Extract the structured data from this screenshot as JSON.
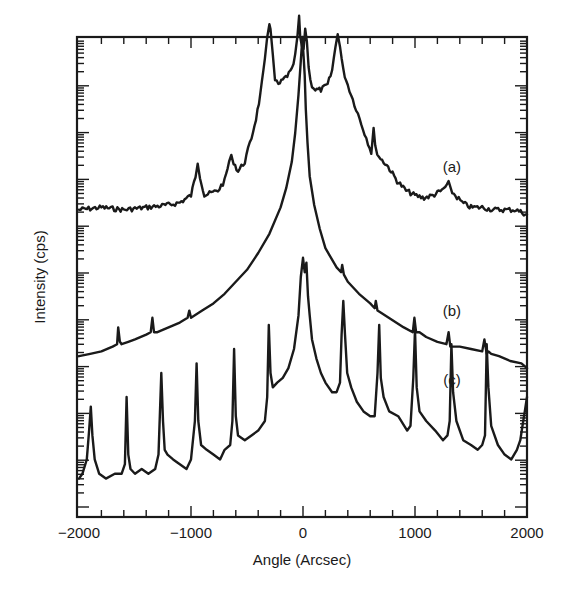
{
  "chart_data": {
    "type": "line",
    "title": "",
    "xlabel": "Angle (Arcsec)",
    "ylabel": "Intensity (cps)",
    "xlim": [
      -2000,
      2000
    ],
    "ylim": [
      0,
      100
    ],
    "y_units_note": "relative (arb.), no y tick labels shown",
    "x_ticks": [
      {
        "value": -2000,
        "label": "−2000"
      },
      {
        "value": -1000,
        "label": "−1000"
      },
      {
        "value": 0,
        "label": "0"
      },
      {
        "value": 1000,
        "label": "1000"
      },
      {
        "value": 2000,
        "label": "2000"
      }
    ],
    "x_minor_step": 200,
    "y_major_count": 10,
    "grid": false,
    "series": [
      {
        "name": "(a)",
        "label_at": {
          "x": 1330,
          "y": 73
        },
        "noisy": true,
        "x": [
          -2000,
          -1800,
          -1600,
          -1400,
          -1200,
          -1100,
          -1000,
          -960,
          -940,
          -920,
          -880,
          -820,
          -760,
          -700,
          -660,
          -640,
          -620,
          -580,
          -520,
          -460,
          -420,
          -380,
          -340,
          -320,
          -300,
          -290,
          -270,
          -250,
          -220,
          -180,
          -140,
          -100,
          -70,
          -50,
          -35,
          -25,
          -10,
          5,
          20,
          35,
          50,
          65,
          80,
          110,
          160,
          220,
          260,
          290,
          310,
          330,
          360,
          400,
          460,
          520,
          580,
          610,
          630,
          645,
          680,
          760,
          840,
          920,
          1000,
          1080,
          1160,
          1240,
          1300,
          1320,
          1360,
          1420,
          1500,
          1600,
          1700,
          1800,
          1900,
          2000
        ],
        "y": [
          64,
          64.5,
          64,
          64.5,
          65,
          65.5,
          67,
          71,
          74,
          71,
          67,
          67.5,
          68,
          70,
          74,
          75,
          74,
          72,
          74,
          79,
          83,
          88,
          95,
          100,
          103,
          102,
          96,
          91,
          90,
          91,
          92,
          93,
          96,
          100,
          104,
          100,
          98,
          97,
          102,
          99,
          94,
          91,
          90,
          89,
          89,
          90,
          93,
          98,
          101,
          98,
          93,
          90,
          86,
          82,
          78,
          76,
          81,
          77,
          75,
          73,
          70,
          68,
          67,
          66.5,
          67,
          68,
          69.5,
          68,
          67,
          65.5,
          64.5,
          64.5,
          64,
          64,
          64,
          63
        ]
      },
      {
        "name": "(b)",
        "label_at": {
          "x": 1330,
          "y": 43
        },
        "noisy": false,
        "x": [
          -2000,
          -1900,
          -1800,
          -1700,
          -1660,
          -1650,
          -1635,
          -1620,
          -1560,
          -1500,
          -1400,
          -1360,
          -1345,
          -1330,
          -1300,
          -1200,
          -1100,
          -1030,
          -1015,
          -1000,
          -900,
          -800,
          -700,
          -600,
          -500,
          -400,
          -300,
          -200,
          -150,
          -100,
          -70,
          -40,
          -20,
          -5,
          5,
          15,
          25,
          40,
          60,
          100,
          150,
          200,
          300,
          340,
          350,
          365,
          400,
          500,
          600,
          640,
          650,
          665,
          700,
          800,
          900,
          980,
          995,
          1010,
          1040,
          1100,
          1200,
          1280,
          1300,
          1315,
          1340,
          1400,
          1500,
          1600,
          1620,
          1640,
          1655,
          1680,
          1750,
          1850,
          1950,
          2000
        ],
        "y": [
          33.5,
          34,
          34.5,
          35.5,
          36,
          39.5,
          36.5,
          36,
          36.5,
          37,
          38,
          38.5,
          41.5,
          38.5,
          38.5,
          39.5,
          40.5,
          41.5,
          43,
          41.5,
          43,
          44.5,
          46.5,
          49,
          51.5,
          55,
          59,
          64.5,
          68.5,
          74,
          80,
          88,
          95,
          100,
          96,
          92,
          85,
          78,
          71,
          65,
          60,
          56,
          52,
          51,
          52.5,
          50.5,
          49,
          46.5,
          44.5,
          43.5,
          45,
          43,
          42.5,
          41,
          39.5,
          38.5,
          41.5,
          38.5,
          38.5,
          37.5,
          36.5,
          36,
          38.5,
          35.5,
          35.5,
          35.5,
          35,
          34.5,
          37,
          34,
          34.5,
          34,
          33.5,
          32.5,
          32,
          31
        ]
      },
      {
        "name": "(c)",
        "label_at": {
          "x": 1330,
          "y": 28.5
        },
        "noisy": false,
        "x": [
          -2000,
          -1970,
          -1930,
          -1910,
          -1895,
          -1880,
          -1860,
          -1820,
          -1760,
          -1680,
          -1620,
          -1590,
          -1575,
          -1560,
          -1540,
          -1500,
          -1440,
          -1380,
          -1320,
          -1290,
          -1265,
          -1250,
          -1235,
          -1210,
          -1160,
          -1100,
          -1040,
          -1000,
          -965,
          -950,
          -935,
          -910,
          -860,
          -800,
          -740,
          -700,
          -650,
          -630,
          -615,
          -600,
          -580,
          -520,
          -460,
          -400,
          -340,
          -320,
          -305,
          -290,
          -270,
          -230,
          -180,
          -130,
          -80,
          -40,
          -20,
          0,
          15,
          30,
          45,
          60,
          80,
          120,
          160,
          200,
          260,
          300,
          330,
          345,
          360,
          375,
          395,
          430,
          480,
          540,
          600,
          640,
          665,
          680,
          695,
          720,
          770,
          850,
          930,
          960,
          985,
          1000,
          1015,
          1040,
          1100,
          1180,
          1250,
          1290,
          1310,
          1325,
          1340,
          1370,
          1430,
          1500,
          1560,
          1600,
          1625,
          1640,
          1655,
          1680,
          1740,
          1800,
          1860,
          1910,
          1940,
          1960,
          1980,
          2000
        ],
        "y": [
          8,
          9,
          12,
          18,
          23,
          17,
          12,
          9,
          8,
          9,
          9,
          11,
          25,
          13,
          10,
          9,
          10,
          9,
          10,
          13,
          30,
          20,
          14,
          13,
          12,
          11,
          10,
          12,
          20,
          32,
          20,
          15,
          14,
          13,
          12,
          14,
          15,
          20,
          35,
          21,
          17,
          16,
          17,
          18,
          20,
          25,
          40,
          30,
          27,
          28,
          29,
          31,
          35,
          42,
          50,
          54,
          51,
          53,
          46,
          42,
          37,
          33,
          30,
          28,
          26,
          26,
          28,
          38,
          45,
          38,
          30,
          27,
          24,
          22,
          21,
          21,
          30,
          40,
          29,
          25,
          22,
          21,
          18,
          19,
          29,
          39,
          27,
          22,
          20,
          18,
          16,
          17,
          20,
          36,
          26,
          20,
          16,
          15,
          14,
          15,
          17,
          36,
          27,
          19,
          15,
          13,
          12,
          14,
          16,
          19,
          22,
          25
        ]
      }
    ]
  }
}
